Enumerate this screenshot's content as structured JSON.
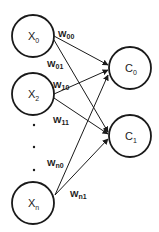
{
  "diagram": {
    "type": "neural-network",
    "colors": {
      "stroke": "#1a1a1a",
      "background": "#ffffff"
    },
    "input_nodes": [
      {
        "id": "x0",
        "base": "X",
        "sub": "0",
        "cx": 33,
        "cy": 36,
        "r": 21
      },
      {
        "id": "x2",
        "base": "X",
        "sub": "2",
        "cx": 33,
        "cy": 94,
        "r": 21
      },
      {
        "id": "xn",
        "base": "X",
        "sub": "n",
        "cx": 33,
        "cy": 203,
        "r": 21
      }
    ],
    "output_nodes": [
      {
        "id": "c0",
        "base": "C",
        "sub": "0",
        "cx": 130,
        "cy": 68,
        "r": 21
      },
      {
        "id": "c1",
        "base": "C",
        "sub": "1",
        "cx": 130,
        "cy": 136,
        "r": 21
      }
    ],
    "ellipsis_dots": [
      {
        "cx": 34,
        "cy": 125
      },
      {
        "cx": 34,
        "cy": 147
      },
      {
        "cx": 34,
        "cy": 170
      }
    ],
    "edges": [
      {
        "from": "x0",
        "to": "c0",
        "x1": 54,
        "y1": 36,
        "x2": 108,
        "y2": 65
      },
      {
        "from": "x0",
        "to": "c1",
        "x1": 54,
        "y1": 40,
        "x2": 108,
        "y2": 132
      },
      {
        "from": "x2",
        "to": "c0",
        "x1": 54,
        "y1": 94,
        "x2": 108,
        "y2": 70
      },
      {
        "from": "x2",
        "to": "c1",
        "x1": 54,
        "y1": 98,
        "x2": 108,
        "y2": 134
      },
      {
        "from": "xn",
        "to": "c0",
        "x1": 55,
        "y1": 195,
        "x2": 108,
        "y2": 75
      },
      {
        "from": "xn",
        "to": "c1",
        "x1": 55,
        "y1": 195,
        "x2": 108,
        "y2": 139
      }
    ],
    "weights": [
      {
        "id": "w00",
        "base": "W",
        "sub": "00",
        "x": 58,
        "y": 37
      },
      {
        "id": "w01",
        "base": "W",
        "sub": "01",
        "x": 47,
        "y": 67
      },
      {
        "id": "w10",
        "base": "W",
        "sub": "10",
        "x": 53,
        "y": 88
      },
      {
        "id": "w11",
        "base": "W",
        "sub": "11",
        "x": 53,
        "y": 123
      },
      {
        "id": "wn0",
        "base": "W",
        "sub": "n0",
        "x": 47,
        "y": 166
      },
      {
        "id": "wn1",
        "base": "W",
        "sub": "n1",
        "x": 70,
        "y": 197
      }
    ]
  }
}
